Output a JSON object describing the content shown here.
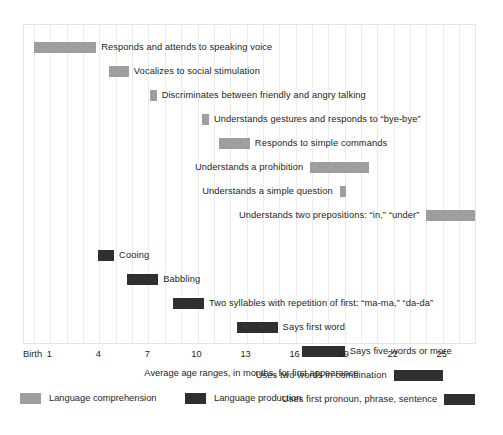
{
  "chart_data": {
    "type": "bar",
    "orientation": "horizontal",
    "subtype": "range-bar",
    "title": "",
    "xlabel": "Average age ranges, in months, for first appearance",
    "ylabel": "",
    "xlim": [
      0,
      27
    ],
    "xticks": [
      0,
      1,
      4,
      7,
      10,
      13,
      16,
      19,
      22,
      25
    ],
    "xtick_labels": [
      "Birth",
      "1",
      "4",
      "7",
      "10",
      "13",
      "16",
      "19",
      "22",
      "25"
    ],
    "grid": true,
    "grid_axis": "x",
    "legend_position": "bottom-left",
    "colors": {
      "comprehension": "#9e9e9e",
      "production": "#2f2f2f",
      "grid": "#ececec",
      "frame": "#e3e3e3",
      "text": "#231f20",
      "background": "#ffffff"
    },
    "legend": [
      {
        "name": "Language comprehension",
        "color": "#9e9e9e"
      },
      {
        "name": "Language production",
        "color": "#2f2f2f"
      }
    ],
    "series": [
      {
        "name": "Language comprehension",
        "color": "#9e9e9e",
        "items": [
          {
            "label": "Responds and attends to speaking voice",
            "start": 0.0,
            "end": 3.8,
            "label_side": "after"
          },
          {
            "label": "Vocalizes to social stimulation",
            "start": 4.6,
            "end": 5.8,
            "label_side": "after"
          },
          {
            "label": "Discriminates between friendly and angry talking",
            "start": 7.1,
            "end": 7.5,
            "label_side": "after"
          },
          {
            "label": "Understands gestures and responds to “bye-bye”",
            "start": 10.3,
            "end": 10.7,
            "label_side": "after"
          },
          {
            "label": "Responds to simple commands",
            "start": 11.3,
            "end": 13.2,
            "label_side": "after"
          },
          {
            "label": "Understands a prohibition",
            "start": 16.9,
            "end": 20.5,
            "label_side": "before"
          },
          {
            "label": "Understands a simple question",
            "start": 18.7,
            "end": 19.1,
            "label_side": "before"
          },
          {
            "label": "Understands two prepositions: “in,” “under”",
            "start": 24.0,
            "end": 27.0,
            "label_side": "before"
          }
        ]
      },
      {
        "name": "Language production",
        "color": "#2f2f2f",
        "items": [
          {
            "label": "Cooing",
            "start": 3.9,
            "end": 4.9,
            "label_side": "after"
          },
          {
            "label": "Babbling",
            "start": 5.7,
            "end": 7.6,
            "label_side": "after"
          },
          {
            "label": "Two syllables with repetition of first: “ma-ma,” “da-da”",
            "start": 8.5,
            "end": 10.4,
            "label_side": "after"
          },
          {
            "label": "Says first word",
            "start": 12.4,
            "end": 14.9,
            "label_side": "after"
          },
          {
            "label": "Says five words or more",
            "start": 16.4,
            "end": 19.0,
            "label_side": "after"
          },
          {
            "label": "Uses two words in combination",
            "start": 22.0,
            "end": 25.0,
            "label_side": "before"
          },
          {
            "label": "Uses first pronoun, phrase, sentence",
            "start": 25.1,
            "end": 27.0,
            "label_side": "before"
          }
        ]
      }
    ]
  }
}
